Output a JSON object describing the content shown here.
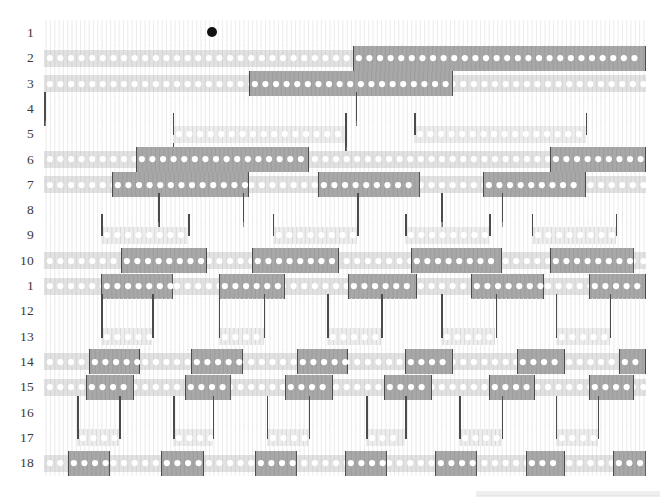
{
  "figure": {
    "title": "",
    "row_count": 18,
    "row_labels": [
      "1",
      "2",
      "3",
      "4",
      "5",
      "6",
      "7",
      "8",
      "9",
      "10",
      "1",
      "12",
      "13",
      "14",
      "15",
      "16",
      "17",
      "18"
    ],
    "plot_left_px": 44,
    "plot_right_px": 646,
    "first_row_y_px": 33,
    "row_spacing_px": 25.3,
    "colors": {
      "background": "#ffffff",
      "label": "#3a3a3a",
      "band_light": "#e2e2e2",
      "band_lighter": "#ededed",
      "block_dark": "#a8a8a8",
      "block_darker": "#9a9a9a",
      "block_edge": "#4b4b4b",
      "dot_white": "#ffffff",
      "dot_black": "#111111",
      "comb": "#dcdcdc",
      "stem": "#4b4b4b"
    },
    "marker": {
      "name": "onset-marker",
      "row": 1,
      "x_fraction": 0.279,
      "radius_px": 5
    },
    "ruler": {
      "x_start_px": 476,
      "x_end_px": 660,
      "y_px": 491,
      "ticks": 92
    }
  },
  "chart_data": {
    "type": "heatmap",
    "title": "",
    "xlabel": "",
    "ylabel": "",
    "categories": [
      "1",
      "2",
      "3",
      "4",
      "5",
      "6",
      "7",
      "8",
      "9",
      "10",
      "11",
      "12",
      "13",
      "14",
      "15",
      "16",
      "17",
      "18"
    ],
    "grid": false,
    "legend": "none",
    "rows": [
      {
        "row": 1,
        "label": "1",
        "band": null,
        "blocks": [],
        "stems": [],
        "point": 0.279
      },
      {
        "row": 2,
        "label": "2",
        "band": [
          0.0,
          1.0
        ],
        "blocks": [
          [
            0.513,
            1.0
          ]
        ],
        "stems": []
      },
      {
        "row": 3,
        "label": "3",
        "band": [
          0.0,
          1.0
        ],
        "blocks": [
          [
            0.34,
            0.68
          ]
        ],
        "stems": []
      },
      {
        "row": 4,
        "label": "4",
        "band": null,
        "blocks": [],
        "stems": [
          0.518,
          0.0
        ]
      },
      {
        "row": 5,
        "label": "5",
        "band": [
          0.214,
          0.5
        ],
        "blocks": [],
        "stems": [
          0.214,
          0.5
        ],
        "bands": [
          [
            0.214,
            0.5
          ],
          [
            0.615,
            0.9
          ]
        ]
      },
      {
        "row": 6,
        "label": "6",
        "band": [
          0.0,
          1.0
        ],
        "blocks": [
          [
            0.152,
            0.44
          ],
          [
            0.84,
            1.0
          ]
        ],
        "stems": []
      },
      {
        "row": 7,
        "label": "7",
        "band": [
          0.0,
          1.0
        ],
        "blocks": [
          [
            0.113,
            0.34
          ],
          [
            0.455,
            0.625
          ],
          [
            0.73,
            0.9
          ]
        ],
        "stems": []
      },
      {
        "row": 8,
        "label": "8",
        "band": null,
        "blocks": [],
        "stems": [
          0.19,
          0.33,
          0.52,
          0.66,
          0.76
        ]
      },
      {
        "row": 9,
        "label": "9",
        "band": null,
        "bands": [
          [
            0.095,
            0.24
          ],
          [
            0.38,
            0.52
          ],
          [
            0.6,
            0.74
          ],
          [
            0.81,
            0.95
          ]
        ],
        "blocks": [],
        "stems": []
      },
      {
        "row": 10,
        "label": "10",
        "band": [
          0.0,
          1.0
        ],
        "blocks": [
          [
            0.128,
            0.27
          ],
          [
            0.345,
            0.49
          ],
          [
            0.61,
            0.76
          ],
          [
            0.84,
            0.98
          ]
        ],
        "stems": []
      },
      {
        "row": 11,
        "label": "1",
        "band": [
          0.0,
          1.0
        ],
        "blocks": [
          [
            0.095,
            0.215
          ],
          [
            0.29,
            0.4
          ],
          [
            0.505,
            0.62
          ],
          [
            0.71,
            0.83
          ],
          [
            0.905,
            1.0
          ]
        ],
        "stems": []
      },
      {
        "row": 12,
        "label": "12",
        "band": null,
        "blocks": [],
        "stems": [
          0.095,
          0.18,
          0.29,
          0.365,
          0.47,
          0.56,
          0.66,
          0.75,
          0.85,
          0.94
        ]
      },
      {
        "row": 13,
        "label": "13",
        "band": null,
        "bands": [
          [
            0.095,
            0.18
          ],
          [
            0.29,
            0.365
          ],
          [
            0.47,
            0.56
          ],
          [
            0.66,
            0.75
          ],
          [
            0.85,
            0.94
          ]
        ],
        "blocks": [],
        "stems": []
      },
      {
        "row": 14,
        "label": "14",
        "band": [
          0.0,
          1.0
        ],
        "blocks": [
          [
            0.075,
            0.16
          ],
          [
            0.245,
            0.33
          ],
          [
            0.42,
            0.505
          ],
          [
            0.6,
            0.68
          ],
          [
            0.785,
            0.865
          ],
          [
            0.955,
            1.0
          ]
        ],
        "stems": []
      },
      {
        "row": 15,
        "label": "15",
        "band": [
          0.0,
          1.0
        ],
        "blocks": [
          [
            0.07,
            0.15
          ],
          [
            0.235,
            0.31
          ],
          [
            0.4,
            0.48
          ],
          [
            0.565,
            0.645
          ],
          [
            0.74,
            0.815
          ],
          [
            0.905,
            0.98
          ]
        ],
        "stems": []
      },
      {
        "row": 16,
        "label": "16",
        "band": null,
        "blocks": [],
        "stems": [
          0.055,
          0.125,
          0.215,
          0.28,
          0.37,
          0.44,
          0.535,
          0.6,
          0.69,
          0.76,
          0.85,
          0.92
        ]
      },
      {
        "row": 17,
        "label": "17",
        "band": null,
        "bands": [
          [
            0.055,
            0.125
          ],
          [
            0.215,
            0.28
          ],
          [
            0.37,
            0.44
          ],
          [
            0.535,
            0.6
          ],
          [
            0.69,
            0.76
          ],
          [
            0.85,
            0.92
          ]
        ],
        "blocks": [],
        "stems": []
      },
      {
        "row": 18,
        "label": "18",
        "band": [
          0.0,
          1.0
        ],
        "blocks": [
          [
            0.04,
            0.11
          ],
          [
            0.195,
            0.265
          ],
          [
            0.35,
            0.42
          ],
          [
            0.5,
            0.57
          ],
          [
            0.65,
            0.72
          ],
          [
            0.8,
            0.865
          ],
          [
            0.945,
            1.0
          ]
        ],
        "stems": []
      }
    ]
  }
}
